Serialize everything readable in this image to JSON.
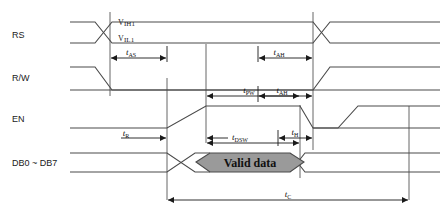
{
  "diagram": {
    "background": "#ffffff",
    "line_color": "#4a4a4a",
    "data_fill": "#9a9a9a",
    "signals": [
      {
        "id": "rs",
        "label": "RS"
      },
      {
        "id": "rw",
        "label": "R/W"
      },
      {
        "id": "en",
        "label": "EN"
      },
      {
        "id": "db",
        "label": "DB0 ~ DB7"
      }
    ],
    "voltage_labels": [
      {
        "id": "vih1",
        "text": "V",
        "sub": "IH1"
      },
      {
        "id": "vil1",
        "text": "V",
        "sub": "IL1"
      }
    ],
    "timing_marks": [
      {
        "id": "tas",
        "base": "t",
        "sub": "AS"
      },
      {
        "id": "tah1",
        "base": "t",
        "sub": "AH"
      },
      {
        "id": "tpw",
        "base": "t",
        "sub": "PW"
      },
      {
        "id": "tah2",
        "base": "t",
        "sub": "AH"
      },
      {
        "id": "tr",
        "base": "t",
        "sub": "R"
      },
      {
        "id": "tdsw",
        "base": "t",
        "sub": "DSW"
      },
      {
        "id": "th",
        "base": "t",
        "sub": "H"
      },
      {
        "id": "tc",
        "base": "t",
        "sub": "C"
      }
    ],
    "data_block": {
      "label": "Valid data"
    }
  }
}
